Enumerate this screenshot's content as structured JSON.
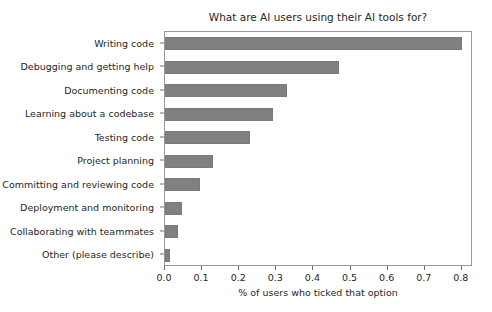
{
  "chart_data": {
    "type": "bar",
    "orientation": "horizontal",
    "title": "What are AI users using their AI tools for?",
    "xlabel": "% of users who ticked that option",
    "ylabel": "",
    "categories": [
      "Writing code",
      "Debugging and getting help",
      "Documenting code",
      "Learning about a codebase",
      "Testing code",
      "Project planning",
      "Committing and reviewing code",
      "Deployment and monitoring",
      "Collaborating with teammates",
      "Other (please describe)"
    ],
    "values": [
      0.8,
      0.47,
      0.33,
      0.29,
      0.23,
      0.13,
      0.095,
      0.045,
      0.035,
      0.013
    ],
    "xlim": [
      0.0,
      0.83
    ],
    "xticks": [
      0.0,
      0.1,
      0.2,
      0.3,
      0.4,
      0.5,
      0.6,
      0.7,
      0.8
    ],
    "xticklabels": [
      "0.0",
      "0.1",
      "0.2",
      "0.3",
      "0.4",
      "0.5",
      "0.6",
      "0.7",
      "0.8"
    ],
    "grid": false,
    "legend": null,
    "bar_color": "#808080",
    "bar_edge_color": "#7a7a7a",
    "axes_color": "#9a9a9a",
    "background": "#ffffff"
  }
}
